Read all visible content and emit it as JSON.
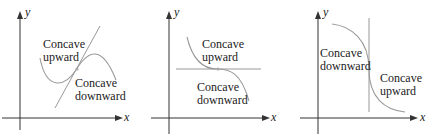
{
  "panels": [
    {
      "id": "a",
      "axis_x": "x",
      "axis_y": "y",
      "label_upper": [
        "Concave",
        "upward"
      ],
      "label_lower": [
        "Concave",
        "downward"
      ],
      "tangent": "slanted line through inflection point"
    },
    {
      "id": "b",
      "axis_x": "x",
      "axis_y": "y",
      "label_upper": [
        "Concave",
        "upward"
      ],
      "label_lower": [
        "Concave",
        "downward"
      ],
      "tangent": "horizontal line through inflection point"
    },
    {
      "id": "c",
      "axis_x": "x",
      "axis_y": "y",
      "label_upper": [
        "Concave",
        "downward"
      ],
      "label_lower": [
        "Concave",
        "upward"
      ],
      "tangent": "vertical line through inflection point"
    }
  ],
  "colors": {
    "curve": "#999999",
    "tangent": "#999999",
    "axis": "#333333",
    "point": "#aaaaaa",
    "text": "#222222"
  }
}
